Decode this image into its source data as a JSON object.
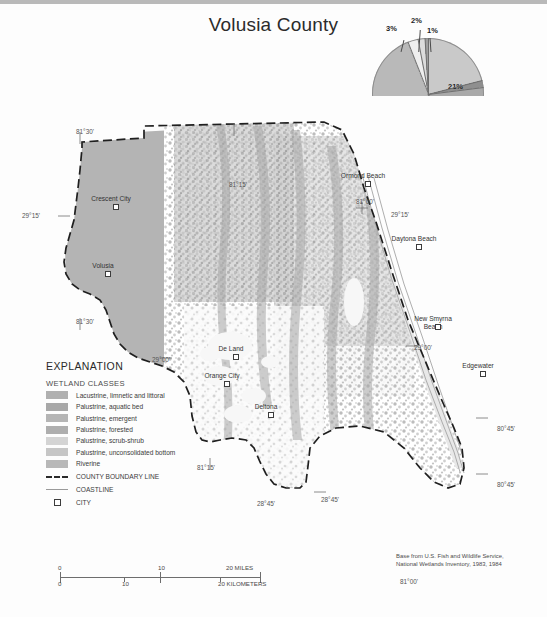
{
  "title": "Volusia County",
  "chart_data": {
    "type": "pie",
    "title": "Volusia County",
    "categories": [
      "Palustrine, forested",
      "Palustrine, emergent",
      "Lacustrine, limnetic and littoral",
      "Palustrine, scrub-shrub",
      "Palustrine, aquatic bed",
      "Palustrine, unconsolidated bottom",
      "Riverine"
    ],
    "values": [
      57,
      21,
      14,
      3,
      2,
      2,
      1
    ],
    "labels": [
      "57%",
      "21%",
      "14%",
      "3%",
      "2%",
      "2%",
      "1%"
    ],
    "colors": [
      "#b9b9b9",
      "#c9c9c9",
      "#a9a9a9",
      "#efefef",
      "#dcdcdc",
      "#8f8f8f",
      "#9e9e9e"
    ],
    "legend_position": "map-explanation",
    "grid": false
  },
  "explanation": {
    "heading": "EXPLANATION",
    "subheading": "WETLAND CLASSES",
    "classes": [
      {
        "label": "Lacustrine, limnetic and littoral",
        "color": "#b0b0b0"
      },
      {
        "label": "Palustrine, aquatic bed",
        "color": "#a8a8a8"
      },
      {
        "label": "Palustrine, emergent",
        "color": "#b5b5b5"
      },
      {
        "label": "Palustrine, forested",
        "color": "#aeaeae"
      },
      {
        "label": "Palustrine, scrub-shrub",
        "color": "#d4d4d4"
      },
      {
        "label": "Palustrine, unconsolidated bottom",
        "color": "#c6c6c6"
      },
      {
        "label": "Riverine",
        "color": "#b8b8b8"
      }
    ],
    "symbols": [
      {
        "label": "COUNTY BOUNDARY LINE",
        "kind": "dashed-line"
      },
      {
        "label": "COASTLINE",
        "kind": "thin-line"
      },
      {
        "label": "CITY",
        "kind": "square"
      }
    ]
  },
  "cities": [
    {
      "name": "Crescent City",
      "x": 85,
      "y": 195
    },
    {
      "name": "Volusia",
      "x": 77,
      "y": 262
    },
    {
      "name": "Ormond Beach",
      "x": 337,
      "y": 172
    },
    {
      "name": "Daytona Beach",
      "x": 388,
      "y": 235
    },
    {
      "name": "New Smyrna Beach",
      "x": 407,
      "y": 315
    },
    {
      "name": "Edgewater",
      "x": 452,
      "y": 362
    },
    {
      "name": "De Land",
      "x": 205,
      "y": 345
    },
    {
      "name": "Orange City",
      "x": 196,
      "y": 372
    },
    {
      "name": "Deltona",
      "x": 240,
      "y": 403
    }
  ],
  "graticule": [
    {
      "text": "81°30'",
      "x": 76,
      "y": 128
    },
    {
      "text": "81°15'",
      "x": 229,
      "y": 181
    },
    {
      "text": "81°00'",
      "x": 356,
      "y": 198
    },
    {
      "text": "29°15'",
      "x": 22,
      "y": 212
    },
    {
      "text": "29°15'",
      "x": 391,
      "y": 211
    },
    {
      "text": "81°30'",
      "x": 76,
      "y": 318
    },
    {
      "text": "29°00'",
      "x": 152,
      "y": 356
    },
    {
      "text": "29°00'",
      "x": 414,
      "y": 344
    },
    {
      "text": "81°15'",
      "x": 197,
      "y": 464
    },
    {
      "text": "28°45'",
      "x": 257,
      "y": 500
    },
    {
      "text": "28°45'",
      "x": 321,
      "y": 496
    },
    {
      "text": "80°45'",
      "x": 497,
      "y": 425
    },
    {
      "text": "80°45'",
      "x": 497,
      "y": 481
    },
    {
      "text": "81°00'",
      "x": 400,
      "y": 578
    }
  ],
  "scalebar": {
    "miles": {
      "ticks": [
        "0",
        "10",
        "20 MILES"
      ]
    },
    "kilometers": {
      "ticks": [
        "0",
        "10",
        "20 KILOMETERS"
      ]
    }
  },
  "credit": {
    "line1": "Base from U.S. Fish and Wildlife Service,",
    "line2": "National Wetlands Inventory, 1983, 1984"
  },
  "caption": ""
}
